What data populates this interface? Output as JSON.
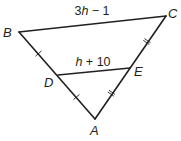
{
  "diagram": {
    "type": "triangle-midsegment",
    "stroke_color": "#231f20",
    "background": "#ffffff",
    "vertices": {
      "A": {
        "label": "A",
        "x": 95,
        "y": 119
      },
      "B": {
        "label": "B",
        "x": 19,
        "y": 32
      },
      "C": {
        "label": "C",
        "x": 166,
        "y": 16
      },
      "D": {
        "label": "D",
        "x": 58,
        "y": 75
      },
      "E": {
        "label": "E",
        "x": 130,
        "y": 68
      }
    },
    "segments": [
      {
        "from": "B",
        "to": "C",
        "label_pre": "3",
        "label_var": "h",
        "label_post": " − 1"
      },
      {
        "from": "D",
        "to": "E",
        "label_pre": "",
        "label_var": "h",
        "label_post": " + 10"
      },
      {
        "from": "B",
        "to": "A"
      },
      {
        "from": "C",
        "to": "A"
      }
    ],
    "congruence_marks": [
      {
        "segment": "BD",
        "ticks": 1
      },
      {
        "segment": "DA",
        "ticks": 1
      },
      {
        "segment": "CE",
        "ticks": 2
      },
      {
        "segment": "EA",
        "ticks": 2
      }
    ]
  }
}
